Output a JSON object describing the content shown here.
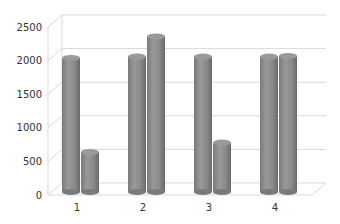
{
  "chart_data": {
    "type": "bar",
    "style": "3d-cylinder-clustered",
    "title": "",
    "xlabel": "",
    "ylabel": "",
    "categories": [
      "1",
      "2",
      "3",
      "4"
    ],
    "series": [
      {
        "name": "Series 1",
        "values": [
          1980,
          2000,
          2000,
          2000
        ]
      },
      {
        "name": "Series 2",
        "values": [
          580,
          2300,
          720,
          2010
        ]
      }
    ],
    "ylim": [
      0,
      2500
    ],
    "yticks": [
      0,
      500,
      1000,
      1500,
      2000,
      2500
    ],
    "grid": true,
    "legend": "none",
    "colors": {
      "bar": "#8c8c8c",
      "bar_dark": "#6e6e6e",
      "bar_light": "#a6a6a6",
      "grid": "#d9d9d9",
      "text": "#333333"
    }
  }
}
